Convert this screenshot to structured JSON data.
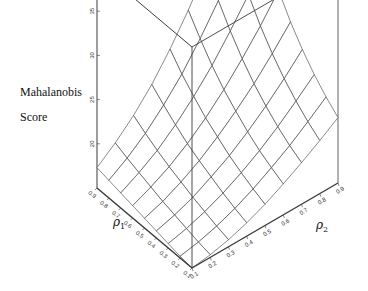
{
  "chart_data": {
    "type": "surface3d",
    "title": "",
    "zlabel_lines": [
      "Mahalanobis",
      "Score"
    ],
    "zlabel": "Mahalanobis Score",
    "x1label": "ρ1",
    "x2label": "ρ2",
    "x1_ticks": [
      "0.1",
      "0.2",
      "0.3",
      "0.4",
      "0.5",
      "0.6",
      "0.7",
      "0.8",
      "0.9"
    ],
    "x2_ticks": [
      "0.1",
      "0.2",
      "0.3",
      "0.4",
      "0.5",
      "0.6",
      "0.7",
      "0.8",
      "0.9"
    ],
    "z_ticks": [
      "20",
      "25",
      "30",
      "35",
      "40"
    ],
    "zlim": [
      15,
      40
    ],
    "x1": [
      0.1,
      0.2,
      0.3,
      0.4,
      0.5,
      0.6,
      0.7,
      0.8,
      0.9
    ],
    "x2": [
      0.1,
      0.2,
      0.3,
      0.4,
      0.5,
      0.6,
      0.7,
      0.8,
      0.9
    ],
    "z_note": "rows indexed by rho1 (0.1..0.9), columns by rho2 (0.1..0.9); values estimated from surface",
    "z": [
      [
        15.0,
        15.3,
        15.8,
        16.5,
        17.4,
        18.5,
        19.7,
        21.0,
        22.4
      ],
      [
        15.2,
        15.6,
        16.2,
        17.0,
        18.0,
        19.2,
        20.5,
        22.0,
        23.6
      ],
      [
        15.5,
        16.0,
        16.7,
        17.6,
        18.7,
        20.0,
        21.5,
        23.2,
        25.0
      ],
      [
        15.8,
        16.4,
        17.2,
        18.3,
        19.5,
        21.0,
        22.7,
        24.6,
        26.7
      ],
      [
        16.1,
        16.8,
        17.8,
        19.0,
        20.5,
        22.2,
        24.1,
        26.3,
        28.7
      ],
      [
        16.4,
        17.3,
        18.4,
        19.8,
        21.5,
        23.5,
        25.8,
        28.3,
        31.1
      ],
      [
        16.7,
        17.8,
        19.1,
        20.8,
        22.8,
        25.1,
        27.8,
        30.7,
        33.9
      ],
      [
        17.0,
        18.3,
        19.9,
        21.9,
        24.2,
        27.0,
        30.1,
        33.5,
        37.0
      ],
      [
        17.3,
        18.9,
        20.8,
        23.1,
        25.9,
        29.1,
        32.7,
        36.4,
        40.0
      ]
    ],
    "grid": false,
    "legend": null
  },
  "colors": {
    "line": "#3a3a3a",
    "background": "#ffffff"
  }
}
